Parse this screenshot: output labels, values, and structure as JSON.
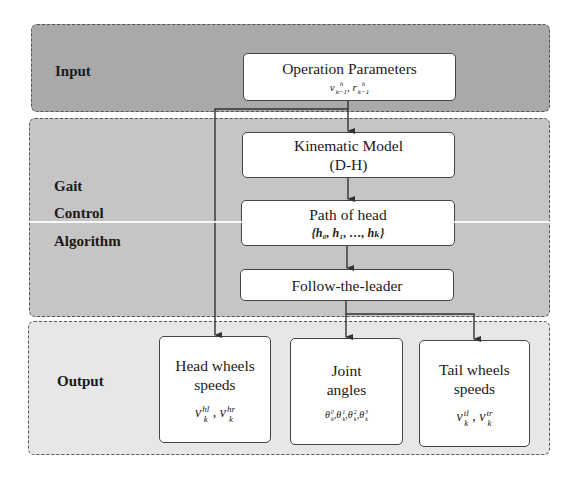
{
  "panels": {
    "input": {
      "label": "Input",
      "color": "#a9a9a9"
    },
    "gait": {
      "label_lines": [
        "Gait",
        "Control",
        "Algorithm"
      ],
      "color": "#c5c5c5"
    },
    "output": {
      "label": "Output",
      "color": "#e7e7e7"
    }
  },
  "boxes": {
    "operation_parameters": {
      "title": "Operation Parameters",
      "math": {
        "var1": "v",
        "var1_sup": "h",
        "var1_sub": "k−1",
        "sep": ", ",
        "var2": "r",
        "var2_sup": "h",
        "var2_sub": "k−1"
      }
    },
    "kinematic_model": {
      "title_line1": "Kinematic Model",
      "title_line2": "(D-H)"
    },
    "path_of_head": {
      "title": "Path of head",
      "math": "{h₀, h₁, …, hₖ}"
    },
    "follow_the_leader": {
      "title": "Follow-the-leader"
    },
    "head_wheels": {
      "title_line1": "Head wheels",
      "title_line2": "speeds",
      "math": {
        "var": "v",
        "sub": "k",
        "sup1": "hl",
        "sup2": "hr",
        "sep": " , "
      }
    },
    "joint_angles": {
      "title_line1": "Joint",
      "title_line2": "angles",
      "math": {
        "var": "θ",
        "sub": "k",
        "sups": [
          "0",
          "1",
          "2",
          "3"
        ],
        "sep": ","
      }
    },
    "tail_wheels": {
      "title_line1": "Tail wheels",
      "title_line2": "speeds",
      "math": {
        "var": "v",
        "sub": "k",
        "sup1": "tl",
        "sup2": "tr",
        "sep": " , "
      }
    }
  },
  "connectors": {
    "line_color": "#333333"
  }
}
